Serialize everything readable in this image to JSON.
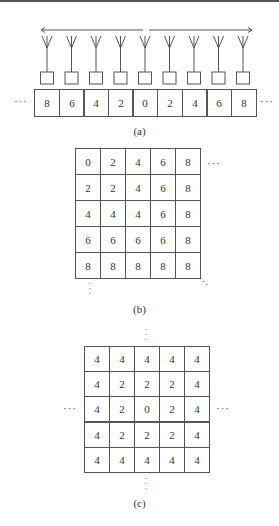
{
  "panels": {
    "a": {
      "caption": "(a)",
      "antenna_count": 9,
      "values": [
        "8",
        "6",
        "4",
        "2",
        "0",
        "2",
        "4",
        "6",
        "8"
      ],
      "left_ellipsis": "···",
      "right_ellipsis": "···"
    },
    "b": {
      "caption": "(b)",
      "grid": [
        [
          "0",
          "2",
          "4",
          "6",
          "8"
        ],
        [
          "2",
          "2",
          "4",
          "6",
          "8"
        ],
        [
          "4",
          "4",
          "4",
          "6",
          "8"
        ],
        [
          "6",
          "6",
          "6",
          "6",
          "8"
        ],
        [
          "8",
          "8",
          "8",
          "8",
          "8"
        ]
      ],
      "right_ellipsis": "···",
      "bottom_ellipsis": "⋮",
      "diag_ellipsis": "⋱"
    },
    "c": {
      "caption": "(c)",
      "grid": [
        [
          "4",
          "4",
          "4",
          "4",
          "4"
        ],
        [
          "4",
          "2",
          "2",
          "2",
          "4"
        ],
        [
          "4",
          "2",
          "0",
          "2",
          "4"
        ],
        [
          "4",
          "2",
          "2",
          "2",
          "4"
        ],
        [
          "4",
          "4",
          "4",
          "4",
          "4"
        ]
      ],
      "left_ellipsis": "···",
      "right_ellipsis": "···",
      "top_ellipsis": "⋮",
      "bottom_ellipsis": "⋮"
    }
  },
  "colors": {
    "line": "#555555",
    "text": "#333333",
    "background": "#ffffff"
  }
}
